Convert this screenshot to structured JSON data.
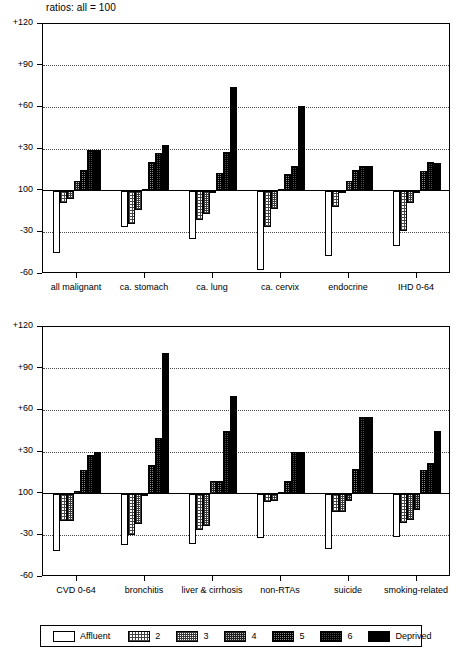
{
  "figure": {
    "title": "ratios: all = 100"
  },
  "legend": {
    "items": [
      {
        "label": "Affluent",
        "fill": "f0"
      },
      {
        "label": "2",
        "fill": "f1"
      },
      {
        "label": "3",
        "fill": "f2"
      },
      {
        "label": "4",
        "fill": "f3"
      },
      {
        "label": "5",
        "fill": "f4"
      },
      {
        "label": "6",
        "fill": "f5"
      },
      {
        "label": "Deprived",
        "fill": "f6"
      }
    ]
  },
  "chart_data": [
    {
      "type": "bar",
      "title": "ratios: all = 100",
      "xlabel": "",
      "ylabel": "",
      "ylim": [
        -60,
        120
      ],
      "yticks": [
        -60,
        -30,
        0,
        30,
        60,
        90,
        120
      ],
      "ytick_labels": [
        "-60",
        "-30",
        "100",
        "+30",
        "+60",
        "+90",
        "+120"
      ],
      "grid": true,
      "baseline": 0,
      "baseline_label": "100",
      "legend_position": "below-figure",
      "categories": [
        "all malignant",
        "ca. stomach",
        "ca. lung",
        "ca. cervix",
        "endocrine",
        "IHD 0-64"
      ],
      "series": [
        {
          "name": "Affluent",
          "fill": "f0",
          "values": [
            -45,
            -26,
            -35,
            -57,
            -47,
            -40
          ]
        },
        {
          "name": "2",
          "fill": "f1",
          "values": [
            -9,
            -24,
            -21,
            -26,
            -12,
            -29
          ]
        },
        {
          "name": "3",
          "fill": "f2",
          "values": [
            -6,
            -14,
            -17,
            -13,
            -2,
            -9
          ]
        },
        {
          "name": "4",
          "fill": "f3",
          "values": [
            7,
            1,
            -2,
            1,
            7,
            -1
          ]
        },
        {
          "name": "5",
          "fill": "f4",
          "values": [
            15,
            21,
            13,
            12,
            15,
            14
          ]
        },
        {
          "name": "6",
          "fill": "f5",
          "values": [
            29,
            27,
            28,
            18,
            18,
            21
          ]
        },
        {
          "name": "Deprived",
          "fill": "f6",
          "values": [
            29,
            33,
            75,
            61,
            18,
            20
          ]
        }
      ]
    },
    {
      "type": "bar",
      "title": "",
      "xlabel": "",
      "ylabel": "",
      "ylim": [
        -60,
        120
      ],
      "yticks": [
        -60,
        -30,
        0,
        30,
        60,
        90,
        120
      ],
      "ytick_labels": [
        "-60",
        "-30",
        "100",
        "+30",
        "+60",
        "+90",
        "+120"
      ],
      "grid": true,
      "baseline": 0,
      "baseline_label": "100",
      "legend_position": "below-figure",
      "categories": [
        "CVD 0-64",
        "bronchitis",
        "liver & cirrhosis",
        "non-RTAs",
        "suicide",
        "smoking-related"
      ],
      "series": [
        {
          "name": "Affluent",
          "fill": "f0",
          "values": [
            -41,
            -37,
            -36,
            -32,
            -40,
            -31
          ]
        },
        {
          "name": "2",
          "fill": "f1",
          "values": [
            -20,
            -30,
            -26,
            -6,
            -13,
            -21
          ]
        },
        {
          "name": "3",
          "fill": "f2",
          "values": [
            -20,
            -22,
            -23,
            -5,
            -13,
            -19
          ]
        },
        {
          "name": "4",
          "fill": "f3",
          "values": [
            2,
            -2,
            9,
            1,
            -5,
            -12
          ]
        },
        {
          "name": "5",
          "fill": "f4",
          "values": [
            17,
            21,
            9,
            9,
            18,
            17
          ]
        },
        {
          "name": "6",
          "fill": "f5",
          "values": [
            28,
            40,
            45,
            30,
            55,
            22
          ]
        },
        {
          "name": "Deprived",
          "fill": "f6",
          "values": [
            30,
            101,
            70,
            30,
            55,
            45
          ]
        }
      ]
    }
  ]
}
